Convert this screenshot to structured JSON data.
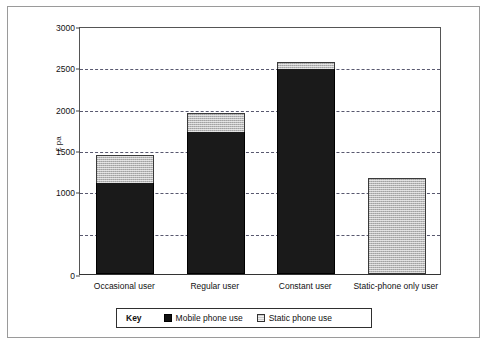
{
  "chart_data": {
    "type": "bar",
    "subtype": "stacked",
    "title": "",
    "xlabel": "",
    "ylabel": "£ pa",
    "ylim": [
      0,
      3000
    ],
    "ytick_labels": [
      "0",
      "1000",
      "1500",
      "2000",
      "2500",
      "3000"
    ],
    "ytick_values": [
      0,
      1000,
      1500,
      2000,
      2500,
      3000
    ],
    "gridlines": [
      500,
      1000,
      1500,
      2000,
      2500
    ],
    "grid": true,
    "grid_style": "dashed",
    "legend_position": "bottom",
    "legend_title": "Key",
    "categories": [
      "Occasional user",
      "Regular user",
      "Constant user",
      "Static-phone only user"
    ],
    "series": [
      {
        "name": "Mobile phone use",
        "color": "#1a1a1a",
        "values": [
          1100,
          1720,
          2480,
          0
        ]
      },
      {
        "name": "Static phone use",
        "color": "#b9b9b9",
        "values": [
          340,
          230,
          90,
          1160
        ]
      }
    ],
    "totals": [
      1440,
      1950,
      2570,
      1160
    ]
  },
  "axes": {
    "y_title": "£ pa"
  },
  "legend": {
    "title": "Key",
    "entries": [
      {
        "label": "Mobile phone use",
        "swatch": "solid-black-square"
      },
      {
        "label": "Static phone use",
        "swatch": "hatched-light-square"
      }
    ]
  },
  "colors": {
    "mobile": "#1a1a1a",
    "static": "#b9b9b9",
    "grid": "#3b3b56",
    "axis": "#333333",
    "frame": "#2b2b2b",
    "background": "#ffffff"
  }
}
